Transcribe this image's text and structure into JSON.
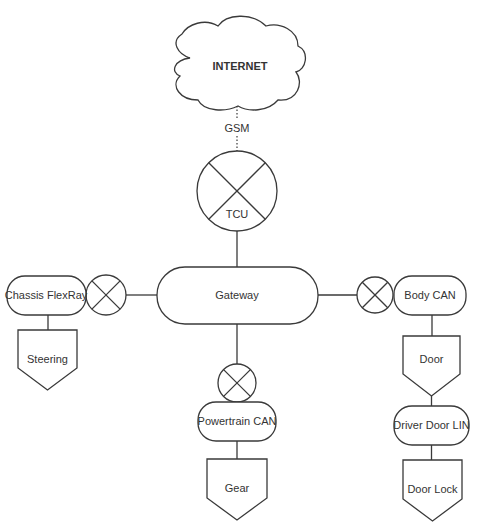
{
  "diagram": {
    "title_fragment": "...pp... ...g...y",
    "cloud": {
      "label": "INTERNET"
    },
    "link_gsm": {
      "label": "GSM"
    },
    "tcu": {
      "label": "TCU"
    },
    "gateway": {
      "label": "Gateway"
    },
    "buses": {
      "chassis": {
        "label": "Chassis FlexRay"
      },
      "body": {
        "label": "Body CAN"
      },
      "powertrain": {
        "label": "Powertrain CAN"
      },
      "driver_door": {
        "label": "Driver Door LIN"
      }
    },
    "ecus": {
      "steering": {
        "label": "Steering"
      },
      "door": {
        "label": "Door"
      },
      "gear": {
        "label": "Gear"
      },
      "door_lock": {
        "label": "Door Lock"
      }
    },
    "colors": {
      "stroke": "#3a3a3a",
      "text": "#333333",
      "background": "#ffffff"
    }
  }
}
